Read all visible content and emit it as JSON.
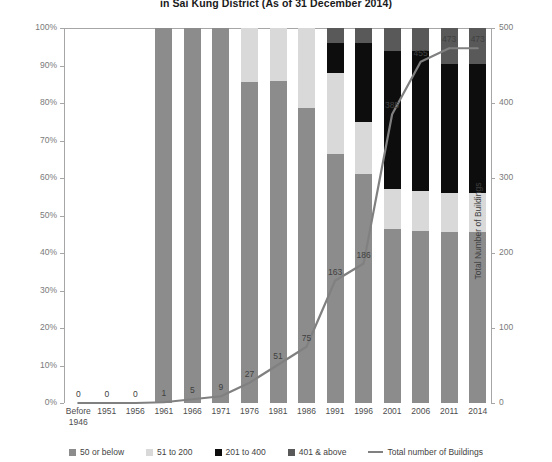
{
  "chart_title": "in Sai Kung District (As of 31 December 2014)",
  "axes": {
    "left_title": "No. of buildings per unit group (%)",
    "right_title": "Total Number of Buildings",
    "left_ticks": [
      "0%",
      "10%",
      "20%",
      "30%",
      "40%",
      "50%",
      "60%",
      "70%",
      "80%",
      "90%",
      "100%"
    ],
    "right_ticks": [
      "0",
      "100",
      "200",
      "300",
      "400",
      "500"
    ]
  },
  "legend": {
    "items": [
      {
        "label": "50 or below",
        "color": "#8c8c8c",
        "type": "swatch"
      },
      {
        "label": "51 to 200",
        "color": "#d9d9d9",
        "type": "swatch"
      },
      {
        "label": "201 to 400",
        "color": "#0d0d0d",
        "type": "swatch"
      },
      {
        "label": "401 & above",
        "color": "#595959",
        "type": "swatch"
      },
      {
        "label": "Total number of Buildings",
        "color": "#808080",
        "type": "line"
      }
    ]
  },
  "chart_data": {
    "type": "bar",
    "title": "in Sai Kung District (As of 31 December 2014)",
    "subtype": "stacked-percentage-bar-with-line-overlay",
    "xlabel": "",
    "ylabel": "No. of buildings per unit group (%)",
    "y2label": "Total Number of Buildings",
    "ylim": [
      0,
      100
    ],
    "y2lim": [
      0,
      500
    ],
    "grid": false,
    "legend_position": "bottom",
    "categories": [
      "Before 1946",
      "1951",
      "1956",
      "1961",
      "1966",
      "1971",
      "1976",
      "1981",
      "1986",
      "1991",
      "1996",
      "2001",
      "2006",
      "2011",
      "2014"
    ],
    "series": [
      {
        "name": "50 or below",
        "color": "#8c8c8c",
        "values": [
          0,
          0,
          0,
          100,
          100,
          100,
          85.5,
          86.0,
          78.8,
          66.5,
          61.0,
          46.5,
          46.0,
          45.5,
          45.5
        ]
      },
      {
        "name": "51 to 200",
        "color": "#d9d9d9",
        "values": [
          0,
          0,
          0,
          0,
          0,
          0,
          14.5,
          14.0,
          21.2,
          21.5,
          14.0,
          10.5,
          10.5,
          10.5,
          10.5
        ]
      },
      {
        "name": "201 to 400",
        "color": "#0d0d0d",
        "values": [
          0,
          0,
          0,
          0,
          0,
          0,
          0,
          0,
          0,
          8.0,
          21.0,
          37.0,
          37.5,
          34.5,
          34.5
        ]
      },
      {
        "name": "401 & above",
        "color": "#595959",
        "values": [
          0,
          0,
          0,
          0,
          0,
          0,
          0,
          0,
          0,
          4.0,
          4.0,
          6.0,
          6.0,
          9.5,
          9.5
        ]
      }
    ],
    "line_series": {
      "name": "Total number of Buildings",
      "color": "#808080",
      "axis": "y2",
      "values": [
        0,
        0,
        0,
        1,
        5,
        9,
        27,
        51,
        75,
        163,
        186,
        385,
        455,
        473,
        473
      ],
      "labels": [
        "0",
        "0",
        "0",
        "1",
        "5",
        "9",
        "27",
        "51",
        "75",
        "163",
        "186",
        "385",
        "455",
        "473",
        "473"
      ]
    }
  }
}
